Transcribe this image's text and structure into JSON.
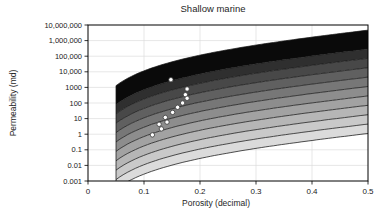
{
  "chart_data": {
    "type": "area",
    "title": "Shallow marine",
    "xlabel": "Porosity (decimal)",
    "ylabel": "Permeability (md)",
    "xlim": [
      0,
      0.5
    ],
    "ylim": [
      0.001,
      10000000
    ],
    "y_log_scale": true,
    "grid": true,
    "x_ticks": [
      {
        "value": 0,
        "label": "0"
      },
      {
        "value": 0.1,
        "label": "0.1"
      },
      {
        "value": 0.2,
        "label": "0.2"
      },
      {
        "value": 0.3,
        "label": "0.3"
      },
      {
        "value": 0.4,
        "label": "0.4"
      },
      {
        "value": 0.5,
        "label": "0.5"
      }
    ],
    "y_ticks": [
      {
        "value": 10000000,
        "label": "10,000,000"
      },
      {
        "value": 1000000,
        "label": "1,000,000"
      },
      {
        "value": 100000,
        "label": "100,000"
      },
      {
        "value": 10000,
        "label": "10,000"
      },
      {
        "value": 1000,
        "label": "1000"
      },
      {
        "value": 100,
        "label": "100"
      },
      {
        "value": 10,
        "label": "10"
      },
      {
        "value": 1,
        "label": "1"
      },
      {
        "value": 0.1,
        "label": "0.1"
      },
      {
        "value": 0.01,
        "label": "0.01"
      },
      {
        "value": 0.001,
        "label": "0.001"
      }
    ],
    "bands": {
      "description": "Global-hydraulic-element style bands; boundary curves k = coefficient * FZI^2 * phi^3 / (1-phi)^2, filled dark-to-light top-to-bottom, drawn from phi_start to 0.5",
      "coefficient": 1014,
      "phi_start": 0.05,
      "fzi_boundaries": [
        96,
        24,
        12,
        6,
        3,
        1.5,
        0.75,
        0.375,
        0.1875,
        0.0938,
        0.0469
      ],
      "fill_colors": [
        "#0a0a0a",
        "#2f2f2f",
        "#484848",
        "#606060",
        "#777777",
        "#8d8d8d",
        "#a2a2a2",
        "#b6b6b6",
        "#c9c9c9",
        "#dbdbdb"
      ],
      "line_color": "#151515"
    },
    "scatter": {
      "marker": "circle",
      "marker_fill": "#ffffff",
      "marker_stroke": "#3a3a3a",
      "points_phi_k": [
        [
          0.148,
          3100
        ],
        [
          0.177,
          790
        ],
        [
          0.174,
          340
        ],
        [
          0.177,
          200
        ],
        [
          0.169,
          100
        ],
        [
          0.16,
          53
        ],
        [
          0.151,
          25
        ],
        [
          0.138,
          12
        ],
        [
          0.141,
          6
        ],
        [
          0.127,
          4.3
        ],
        [
          0.131,
          2.2
        ],
        [
          0.115,
          0.9
        ]
      ]
    },
    "colors": {
      "grid": "#dcdcdc",
      "frame": "#000000",
      "text": "#1a1a1a",
      "background": "#ffffff"
    },
    "plot_area_px": {
      "left": 88,
      "top": 25,
      "right": 368,
      "bottom": 181
    }
  }
}
